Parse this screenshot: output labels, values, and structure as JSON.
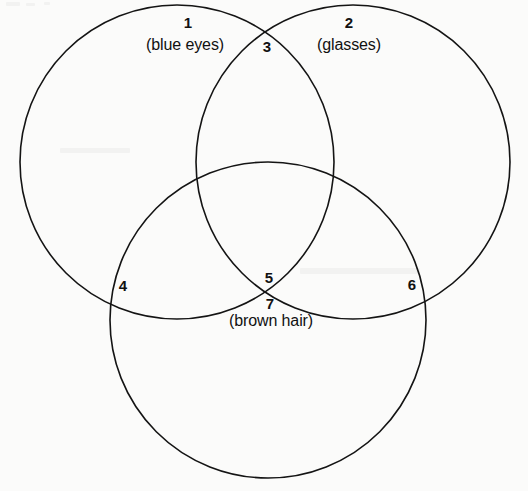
{
  "diagram": {
    "type": "venn-3-circle",
    "title": "",
    "stroke_color": "#141414",
    "background_color": "#fbfbfa",
    "stroke_width": 1.6,
    "circles": [
      {
        "id": "blue-eyes",
        "name": "blue eyes",
        "cx": 177,
        "cy": 162,
        "r": 157
      },
      {
        "id": "glasses",
        "name": "glasses",
        "cx": 353,
        "cy": 162,
        "r": 157
      },
      {
        "id": "brown-hair",
        "name": "brown hair",
        "cx": 268,
        "cy": 320,
        "r": 158
      }
    ],
    "regions": [
      {
        "number": "1",
        "caption": "(blue eyes)",
        "x": 188,
        "y": 22,
        "caption_x": 185,
        "caption_y": 45
      },
      {
        "number": "2",
        "caption": "(glasses)",
        "x": 349,
        "y": 22,
        "caption_x": 349,
        "caption_y": 45
      },
      {
        "number": "3",
        "caption": "",
        "x": 267,
        "y": 46,
        "caption_x": null,
        "caption_y": null
      },
      {
        "number": "4",
        "caption": "",
        "x": 123,
        "y": 285,
        "caption_x": null,
        "caption_y": null
      },
      {
        "number": "5",
        "caption": "",
        "x": 269,
        "y": 277,
        "caption_x": null,
        "caption_y": null
      },
      {
        "number": "6",
        "caption": "",
        "x": 412,
        "y": 284,
        "caption_x": null,
        "caption_y": null
      },
      {
        "number": "7",
        "caption": "(brown hair)",
        "x": 270,
        "y": 303,
        "caption_x": 271,
        "caption_y": 321
      }
    ]
  }
}
